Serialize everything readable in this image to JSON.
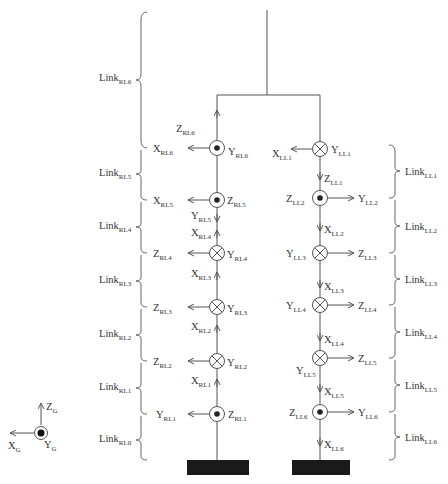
{
  "diagram": {
    "global_frame": {
      "x": "X",
      "x_sub": "G",
      "y": "Y",
      "y_sub": "G",
      "z": "Z",
      "z_sub": "G"
    },
    "right_leg": {
      "links": [
        {
          "name": "Link",
          "sub": "RL6"
        },
        {
          "name": "Link",
          "sub": "RL5"
        },
        {
          "name": "Link",
          "sub": "RL4"
        },
        {
          "name": "Link",
          "sub": "RL3"
        },
        {
          "name": "Link",
          "sub": "RL2"
        },
        {
          "name": "Link",
          "sub": "RL1"
        },
        {
          "name": "Link",
          "sub": "RL0"
        }
      ],
      "joints": [
        {
          "id": "RL6",
          "symbol": "dot",
          "left": "X",
          "left_sub": "RL6",
          "top": "Z",
          "top_sub": "RL6",
          "right": "Y",
          "right_sub": "RL6"
        },
        {
          "id": "RL5",
          "symbol": "dot",
          "left": "X",
          "left_sub": "RL5",
          "right": "Z",
          "right_sub": "RL5",
          "below1": "Y",
          "below1_sub": "RL5",
          "below2": "X",
          "below2_sub": "RL4"
        },
        {
          "id": "RL4",
          "symbol": "cross",
          "left": "Z",
          "left_sub": "RL4",
          "right": "Y",
          "right_sub": "RL4",
          "below": "X",
          "below_sub": "RL3"
        },
        {
          "id": "RL3",
          "symbol": "cross",
          "left": "Z",
          "left_sub": "RL3",
          "right": "Y",
          "right_sub": "RL3",
          "below": "X",
          "below_sub": "RL2"
        },
        {
          "id": "RL2",
          "symbol": "cross",
          "left": "Z",
          "left_sub": "RL2",
          "right": "Y",
          "right_sub": "RL2",
          "below": "X",
          "below_sub": "RL1"
        },
        {
          "id": "RL1",
          "symbol": "dot",
          "left": "Y",
          "left_sub": "RL1",
          "right": "Z",
          "right_sub": "RL1"
        }
      ]
    },
    "left_leg": {
      "links": [
        {
          "name": "Link",
          "sub": "LL1"
        },
        {
          "name": "Link",
          "sub": "LL2"
        },
        {
          "name": "Link",
          "sub": "LL3"
        },
        {
          "name": "Link",
          "sub": "LL4"
        },
        {
          "name": "Link",
          "sub": "LL5"
        },
        {
          "name": "Link",
          "sub": "LL6"
        }
      ],
      "joints": [
        {
          "id": "LL1",
          "symbol": "cross",
          "left": "X",
          "left_sub": "LL1",
          "right": "Y",
          "right_sub": "LL1",
          "below": "Z",
          "below_sub": "LL1"
        },
        {
          "id": "LL2",
          "symbol": "dot",
          "left": "Z",
          "left_sub": "LL2",
          "right": "Y",
          "right_sub": "LL2",
          "below": "X",
          "below_sub": "LL2"
        },
        {
          "id": "LL3",
          "symbol": "cross",
          "left": "Y",
          "left_sub": "LL3",
          "right": "Z",
          "right_sub": "LL3",
          "below": "X",
          "below_sub": "LL3"
        },
        {
          "id": "LL4",
          "symbol": "cross",
          "left": "Y",
          "left_sub": "LL4",
          "right": "Z",
          "right_sub": "LL4",
          "below": "X",
          "below_sub": "LL4"
        },
        {
          "id": "LL5",
          "symbol": "cross",
          "left": "Y",
          "left_sub": "LL5",
          "right": "Z",
          "right_sub": "LL5",
          "below": "X",
          "below_sub": "LL5"
        },
        {
          "id": "LL6",
          "symbol": "dot",
          "left": "Z",
          "left_sub": "LL6",
          "right": "Y",
          "right_sub": "LL6",
          "below": "X",
          "below_sub": "LL6"
        }
      ]
    },
    "colors": {
      "line": "#555555",
      "text": "#333333",
      "foot": "#1a1a1a",
      "background": "#ffffff"
    }
  }
}
